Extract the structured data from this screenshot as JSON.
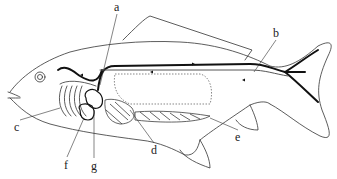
{
  "diagram": {
    "labels": [
      {
        "id": "a",
        "text": "a",
        "x": 114,
        "y": 1
      },
      {
        "id": "b",
        "text": "b",
        "x": 273,
        "y": 27
      },
      {
        "id": "c",
        "text": "c",
        "x": 14,
        "y": 121
      },
      {
        "id": "d",
        "text": "d",
        "x": 151,
        "y": 144
      },
      {
        "id": "e",
        "text": "e",
        "x": 235,
        "y": 131
      },
      {
        "id": "f",
        "text": "f",
        "x": 64,
        "y": 159
      },
      {
        "id": "g",
        "text": "g",
        "x": 91,
        "y": 160
      }
    ],
    "colors": {
      "line": "#333333",
      "vessel": "#111111",
      "background": "#ffffff"
    }
  }
}
